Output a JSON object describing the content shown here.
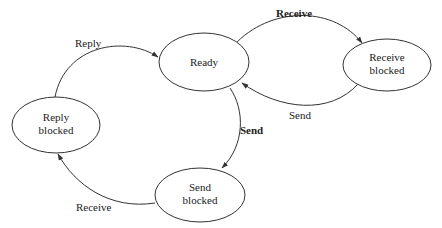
{
  "diagram": {
    "type": "state-diagram",
    "states": [
      {
        "id": "ready",
        "line1": "Ready",
        "line2": ""
      },
      {
        "id": "receive_blocked",
        "line1": "Receive",
        "line2": "blocked"
      },
      {
        "id": "reply_blocked",
        "line1": "Reply",
        "line2": "blocked"
      },
      {
        "id": "send_blocked",
        "line1": "Send",
        "line2": "blocked"
      }
    ],
    "transitions": [
      {
        "from": "ready",
        "to": "receive_blocked",
        "label": "Receive",
        "bold": true
      },
      {
        "from": "receive_blocked",
        "to": "ready",
        "label": "Send",
        "bold": false
      },
      {
        "from": "ready",
        "to": "send_blocked",
        "label": "Send",
        "bold": true
      },
      {
        "from": "send_blocked",
        "to": "reply_blocked",
        "label": "Receive",
        "bold": false
      },
      {
        "from": "reply_blocked",
        "to": "ready",
        "label": "Reply",
        "bold": false
      }
    ],
    "colors": {
      "stroke": "#333333",
      "text": "#222222",
      "background": "#ffffff"
    }
  }
}
